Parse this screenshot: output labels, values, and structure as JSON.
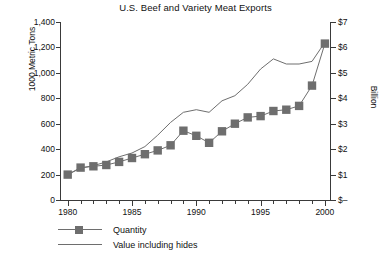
{
  "chart_data": {
    "type": "line",
    "title": "U.S. Beef and Variety Meat Exports",
    "xlabel": "",
    "ylabel": "1000 Metric Tons",
    "y2label": "Billion",
    "grid": false,
    "legend_position": "bottom-left",
    "x": [
      1980,
      1981,
      1982,
      1983,
      1984,
      1985,
      1986,
      1987,
      1988,
      1989,
      1990,
      1991,
      1992,
      1993,
      1994,
      1995,
      1996,
      1997,
      1998,
      1999,
      2000
    ],
    "xlim": [
      1979.4,
      2000.4
    ],
    "xticks": [
      1980,
      1985,
      1990,
      1995,
      2000
    ],
    "xticklabels": [
      "1980",
      "1985",
      "1990",
      "1995",
      "2000"
    ],
    "ylim": [
      0,
      1400
    ],
    "yticks": [
      0,
      200,
      400,
      600,
      800,
      1000,
      1200,
      1400
    ],
    "yticklabels": [
      "0",
      "200",
      "400",
      "600",
      "800",
      "1,000",
      "1,200",
      "1,400"
    ],
    "y2lim": [
      0,
      7
    ],
    "y2ticks": [
      0,
      1,
      2,
      3,
      4,
      5,
      6,
      7
    ],
    "y2ticklabels": [
      "$–",
      "$1",
      "$2",
      "$3",
      "$4",
      "$5",
      "$6",
      "$7"
    ],
    "series": [
      {
        "name": "Quantity",
        "axis": "left",
        "units": "1000 Metric Tons",
        "marker": "square",
        "color": "#6e6e6e",
        "values": [
          200,
          255,
          265,
          275,
          300,
          330,
          360,
          390,
          430,
          545,
          505,
          450,
          540,
          600,
          650,
          660,
          700,
          710,
          740,
          900,
          1230
        ]
      },
      {
        "name": "Value including hides",
        "axis": "right",
        "units": "Billion",
        "marker": "none",
        "color": "#6e6e6e",
        "values": [
          1.0,
          1.25,
          1.35,
          1.5,
          1.7,
          1.85,
          2.1,
          2.55,
          3.05,
          3.45,
          3.55,
          3.45,
          3.9,
          4.1,
          4.55,
          5.15,
          5.55,
          5.35,
          5.35,
          5.45,
          6.2
        ]
      }
    ]
  },
  "legend": {
    "items": [
      {
        "label": "Quantity",
        "style": "line-marker"
      },
      {
        "label": "Value including hides",
        "style": "line"
      }
    ]
  }
}
